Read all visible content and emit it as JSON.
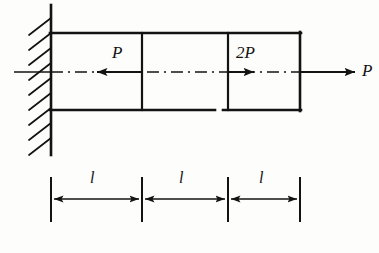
{
  "figure": {
    "kind": "mechanics-free-body-diagram",
    "background_color": "#fdfdfc",
    "line_color": "#131313",
    "canvas": {
      "width": 379,
      "height": 253
    }
  },
  "support": {
    "type": "fixed-wall",
    "name": "wall-support",
    "vertical_line": {
      "x": 51,
      "y1": 5,
      "y2": 155,
      "stroke_width": 2.6
    },
    "hatching": {
      "count": 9,
      "start_y": 18,
      "spacing": 15,
      "dx": -22,
      "dy": 17,
      "stroke_width": 1.7
    }
  },
  "bar": {
    "name": "bar-outline",
    "x_left": 51,
    "x_right": 300,
    "y_top": 33,
    "y_bottom": 110,
    "stroke_width": 2.6,
    "bottom_gap": {
      "x1": 215,
      "x2": 223
    },
    "dividers": [
      {
        "name": "bar-divider-1",
        "x": 142,
        "stroke_width": 2.2
      },
      {
        "name": "bar-divider-2",
        "x": 228,
        "stroke_width": 2.2
      }
    ]
  },
  "axis": {
    "name": "center-axis",
    "y": 72,
    "x_start": 14,
    "x_end": 300,
    "style": "dash-dot",
    "stroke_width": 1.6
  },
  "loads": [
    {
      "name": "load-P-internal",
      "label": "P",
      "direction": "left",
      "tail_x": 142,
      "head_x": 95,
      "y": 72,
      "label_x": 116,
      "label_y": 47,
      "stroke_width": 2.0
    },
    {
      "name": "load-2P-internal",
      "label": "2P",
      "direction": "right",
      "tail_x": 228,
      "head_x": 256,
      "y": 72,
      "label_x": 239,
      "label_y": 47,
      "stroke_width": 2.0
    },
    {
      "name": "load-P-end",
      "label": "P",
      "direction": "right",
      "tail_x": 300,
      "head_x": 357,
      "y": 72,
      "label_x": 362,
      "label_y": 62,
      "stroke_width": 2.0
    }
  ],
  "dimensions": {
    "name": "dimension-chain",
    "line_y": 199,
    "tick_top": 178,
    "tick_bottom": 221,
    "tick_stroke_width": 2.0,
    "line_stroke_width": 1.6,
    "ticks": [
      51,
      142,
      228,
      300
    ],
    "segments": [
      {
        "name": "dimension-segment-1",
        "label": "l",
        "x1": 51,
        "x2": 142,
        "label_x": 92,
        "label_y": 172
      },
      {
        "name": "dimension-segment-2",
        "label": "l",
        "x1": 142,
        "x2": 228,
        "label_x": 181,
        "label_y": 172
      },
      {
        "name": "dimension-segment-3",
        "label": "l",
        "x1": 228,
        "x2": 300,
        "label_x": 261,
        "label_y": 172
      }
    ]
  }
}
